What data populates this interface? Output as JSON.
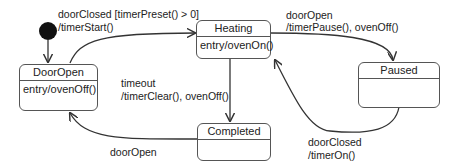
{
  "states": {
    "door_open": {
      "name": "DoorOpen",
      "action": "entry/ovenOff()"
    },
    "heating": {
      "name": "Heating",
      "action": "entry/ovenOn()"
    },
    "paused": {
      "name": "Paused",
      "action": ""
    },
    "completed": {
      "name": "Completed",
      "action": ""
    }
  },
  "transitions": {
    "start_heating": {
      "line1": "doorClosed [timerPreset() > 0]",
      "line2": "/timerStart()"
    },
    "pause": {
      "line1": "doorOpen",
      "line2": "/timerPause(), ovenOff()"
    },
    "timeout": {
      "line1": "timeout",
      "line2": "/timerClear(), ovenOff()"
    },
    "resume": {
      "line1": "doorClosed",
      "line2": "/timerOn()"
    },
    "reopen": {
      "line1": "doorOpen"
    }
  },
  "colors": {
    "line": "#333333",
    "border": "#555555",
    "initial": "#111111"
  }
}
